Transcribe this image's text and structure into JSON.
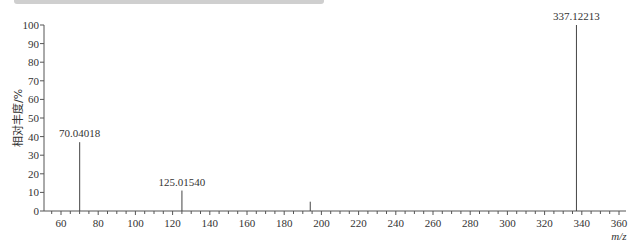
{
  "chart_data": {
    "type": "bar",
    "subtype": "mass-spectrum-stick",
    "title": "",
    "xlabel": "m/z",
    "ylabel": "相对丰度/%",
    "xlim": [
      50,
      360
    ],
    "ylim": [
      0,
      100
    ],
    "xticks": [
      60,
      80,
      100,
      120,
      140,
      160,
      180,
      200,
      220,
      240,
      260,
      280,
      300,
      320,
      340,
      360
    ],
    "yticks": [
      0,
      10,
      20,
      30,
      40,
      50,
      60,
      70,
      80,
      90,
      100
    ],
    "grid": false,
    "legend": null,
    "peaks": [
      {
        "mz": 70.04018,
        "intensity": 37,
        "label": "70.04018"
      },
      {
        "mz": 125.0154,
        "intensity": 11,
        "label": "125.01540"
      },
      {
        "mz": 194.0,
        "intensity": 5,
        "label": ""
      },
      {
        "mz": 337.12213,
        "intensity": 100,
        "label": "337.12213"
      }
    ]
  },
  "axes": {
    "xlabel": "m/z",
    "ylabel": "相对丰度/%"
  }
}
